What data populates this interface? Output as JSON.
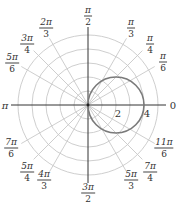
{
  "chart_data": {
    "type": "polar",
    "title": "",
    "curve": {
      "equation": "r = 4cos(theta)",
      "description": "circle of radius 2 centered at (2, 0) passing through origin and r=4 at theta=0",
      "color": "#7a7a7a"
    },
    "radial_grid": {
      "rings": [
        1,
        2,
        3,
        4,
        5
      ],
      "labeled_ticks": [
        "2",
        "4"
      ],
      "color": "#c8c8c8"
    },
    "angular_grid": {
      "spokes_degrees": [
        0,
        30,
        45,
        60,
        90,
        120,
        135,
        150,
        180,
        210,
        225,
        240,
        270,
        300,
        315,
        330
      ],
      "color": "#c8c8c8"
    },
    "axes_color": "#333333"
  },
  "labels": {
    "angles": [
      {
        "id": "pi-over-2",
        "num": "π",
        "den": "2",
        "x": 88,
        "y": 16
      },
      {
        "id": "2pi-over-3",
        "num": "2π",
        "den": "3",
        "x": 46,
        "y": 28
      },
      {
        "id": "pi-over-3",
        "num": "π",
        "den": "3",
        "x": 131,
        "y": 28
      },
      {
        "id": "3pi-over-4",
        "num": "3π",
        "den": "4",
        "x": 27,
        "y": 44
      },
      {
        "id": "pi-over-4",
        "num": "π",
        "den": "4",
        "x": 150,
        "y": 44
      },
      {
        "id": "5pi-over-6",
        "num": "5π",
        "den": "6",
        "x": 12,
        "y": 63
      },
      {
        "id": "pi-over-6",
        "num": "π",
        "den": "6",
        "x": 163,
        "y": 62
      },
      {
        "id": "7pi-over-6",
        "num": "7π",
        "den": "6",
        "x": 11,
        "y": 148
      },
      {
        "id": "11pi-over-6",
        "num": "11π",
        "den": "6",
        "x": 164,
        "y": 148
      },
      {
        "id": "5pi-over-4",
        "num": "5π",
        "den": "4",
        "x": 27,
        "y": 172
      },
      {
        "id": "7pi-over-4",
        "num": "7π",
        "den": "4",
        "x": 150,
        "y": 172
      },
      {
        "id": "4pi-over-3",
        "num": "4π",
        "den": "3",
        "x": 44,
        "y": 180
      },
      {
        "id": "5pi-over-3",
        "num": "5π",
        "den": "3",
        "x": 131,
        "y": 180
      },
      {
        "id": "3pi-over-2",
        "num": "3π",
        "den": "2",
        "x": 88,
        "y": 193
      }
    ],
    "pi": "π",
    "zero": "0",
    "tick_2": "2",
    "tick_4": "4"
  }
}
